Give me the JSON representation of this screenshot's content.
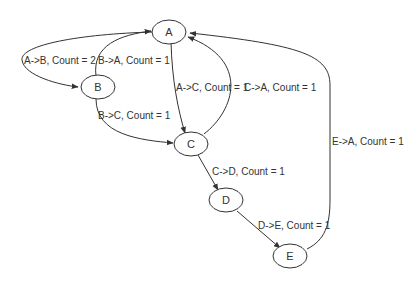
{
  "diagram": {
    "type": "state-transition-graph",
    "nodes": [
      {
        "id": "A",
        "label": "A"
      },
      {
        "id": "B",
        "label": "B"
      },
      {
        "id": "C",
        "label": "C"
      },
      {
        "id": "D",
        "label": "D"
      },
      {
        "id": "E",
        "label": "E"
      }
    ],
    "edges": [
      {
        "from": "A",
        "to": "B",
        "label": "A->B, Count = 2"
      },
      {
        "from": "B",
        "to": "A",
        "label": "B->A, Count = 1"
      },
      {
        "from": "A",
        "to": "C",
        "label": "A->C, Count = 1"
      },
      {
        "from": "C",
        "to": "A",
        "label": "C->A, Count = 1"
      },
      {
        "from": "B",
        "to": "C",
        "label": "B->C, Count = 1"
      },
      {
        "from": "C",
        "to": "D",
        "label": "C->D, Count = 1"
      },
      {
        "from": "D",
        "to": "E",
        "label": "D->E, Count = 1"
      },
      {
        "from": "E",
        "to": "A",
        "label": "E->A, Count = 1"
      }
    ]
  },
  "colors": {
    "stroke": "#333333",
    "background": "#ffffff"
  }
}
